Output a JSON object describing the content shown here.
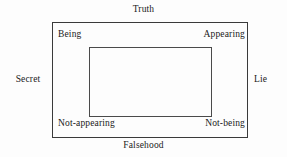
{
  "diagram": {
    "type": "semiotic-square",
    "title": "",
    "background_color": "#fdfdfd",
    "text_color": "#1a1a1a",
    "outer_box": {
      "border_color": "#3a3a3a",
      "border_width_px": 1
    },
    "inner_box": {
      "border_color": "#4a4a4a",
      "border_width_px": 1
    },
    "axis_labels": {
      "top": "Truth",
      "bottom": "Falsehood",
      "left": "Secret",
      "right": "Lie"
    },
    "corner_labels": {
      "top_left": "Being",
      "top_right": "Appearing",
      "bottom_left": "Not-appearing",
      "bottom_right": "Not-being"
    }
  }
}
